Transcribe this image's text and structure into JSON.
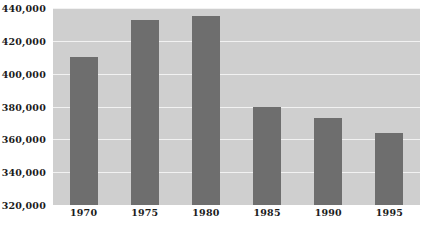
{
  "chart_data": {
    "type": "bar",
    "title": "",
    "subtitle": "",
    "xlabel": "",
    "ylabel": "",
    "categories": [
      "1970",
      "1975",
      "1980",
      "1985",
      "1990",
      "1995"
    ],
    "values": [
      410000,
      433000,
      435000,
      380000,
      373000,
      364000
    ],
    "ylim": [
      320000,
      440000
    ],
    "ytick_step": 20000,
    "ytick_labels": [
      "440,000",
      "420,000",
      "400,000",
      "380,000",
      "360,000",
      "340,000",
      "320,000"
    ],
    "ytick_values": [
      440000,
      420000,
      400000,
      380000,
      360000,
      340000,
      320000
    ],
    "grid": true,
    "legend": false,
    "legend_position": "none",
    "series": [
      {
        "name": "",
        "values": [
          410000,
          433000,
          435000,
          380000,
          373000,
          364000
        ]
      }
    ]
  },
  "style": {
    "bar_color": "#6e6e6e",
    "plot_background": "#cfcfcf",
    "gridline_color": "#f2f2f2",
    "page_background": "#ffffff",
    "label_color": "#1b1b1b"
  }
}
